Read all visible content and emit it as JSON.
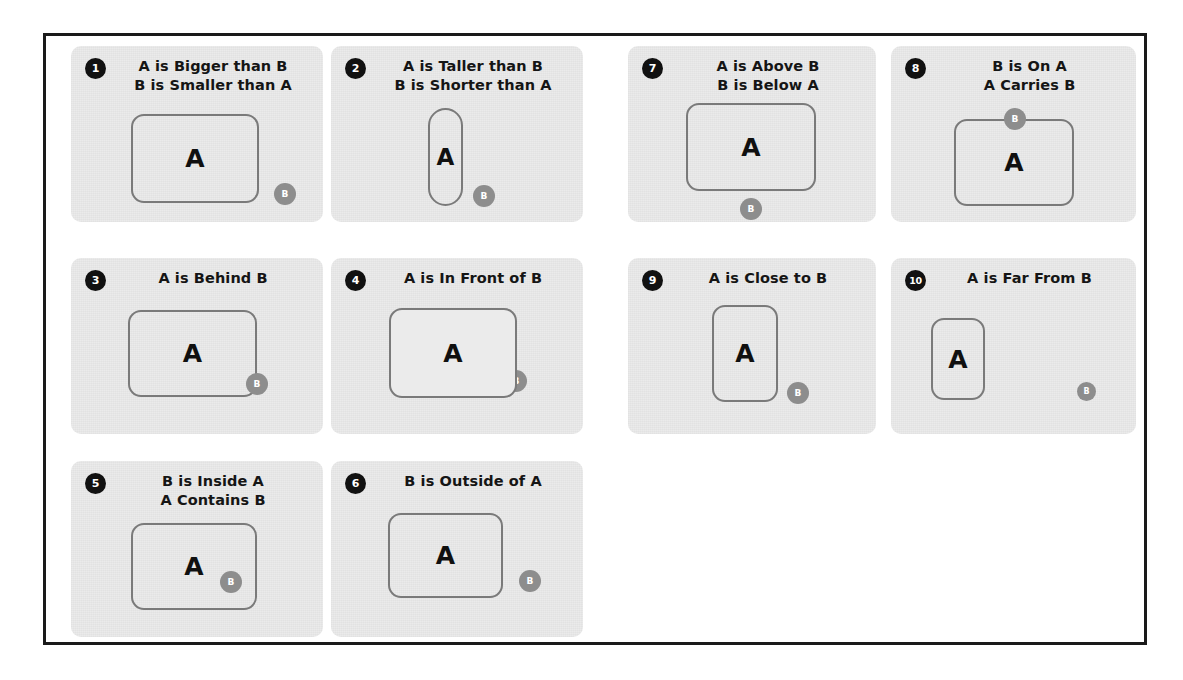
{
  "figure": {
    "border_color": "#1a1a1a",
    "panel_bg": "#ebebeb",
    "badge_bg": "#111111",
    "shape_stroke": "#7a7a7a",
    "b_fill": "#8d8d8d",
    "a_label": "A",
    "b_label": "B"
  },
  "panels": [
    {
      "number": "1",
      "title_lines": [
        "A is Bigger than B",
        "B is Smaller than A"
      ],
      "a_label": "A",
      "b_label": "B"
    },
    {
      "number": "2",
      "title_lines": [
        "A is Taller than B",
        "B is Shorter than A"
      ],
      "a_label": "A",
      "b_label": "B"
    },
    {
      "number": "7",
      "title_lines": [
        "A is Above B",
        "B is Below A"
      ],
      "a_label": "A",
      "b_label": "B"
    },
    {
      "number": "8",
      "title_lines": [
        "B is On A",
        "A Carries B"
      ],
      "a_label": "A",
      "b_label": "B"
    },
    {
      "number": "3",
      "title_lines": [
        "A is Behind B"
      ],
      "a_label": "A",
      "b_label": "B"
    },
    {
      "number": "4",
      "title_lines": [
        "A is In Front of B"
      ],
      "a_label": "A",
      "b_label": "B"
    },
    {
      "number": "9",
      "title_lines": [
        "A is Close to B"
      ],
      "a_label": "A",
      "b_label": "B"
    },
    {
      "number": "10",
      "title_lines": [
        "A is Far From B"
      ],
      "a_label": "A",
      "b_label": "B"
    },
    {
      "number": "5",
      "title_lines": [
        "B is Inside A",
        "A Contains B"
      ],
      "a_label": "A",
      "b_label": "B"
    },
    {
      "number": "6",
      "title_lines": [
        "B is Outside of A"
      ],
      "a_label": "A",
      "b_label": "B"
    }
  ]
}
